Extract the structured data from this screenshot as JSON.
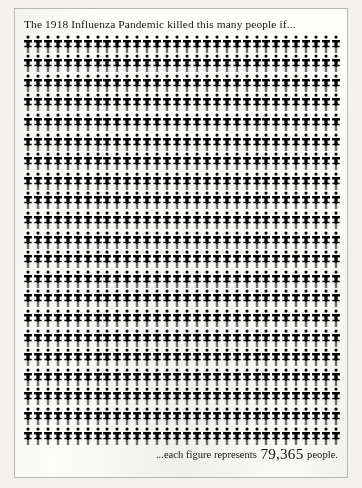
{
  "page": {
    "background_color": "#f2f1ef",
    "paper_color": "#fdfdfb",
    "border_color": "#b9b7b2"
  },
  "title": "The 1918 Influenza Pandemic killed this many people if...",
  "caption": {
    "prefix": "...each figure represents",
    "number": "79,365",
    "suffix": "people."
  },
  "chart_data": {
    "type": "pictogram",
    "title": "The 1918 Influenza Pandemic killed this many people if...",
    "icon": "person-figure-icon",
    "icon_color": "#0b0a08",
    "unit_value": 79365,
    "unit_label": "people",
    "columns": 32,
    "rows": 21,
    "total_icons": 672,
    "represented_total": 53333280,
    "annotation": "...each figure represents 79,365 people.",
    "legend": "none",
    "grid": false
  }
}
